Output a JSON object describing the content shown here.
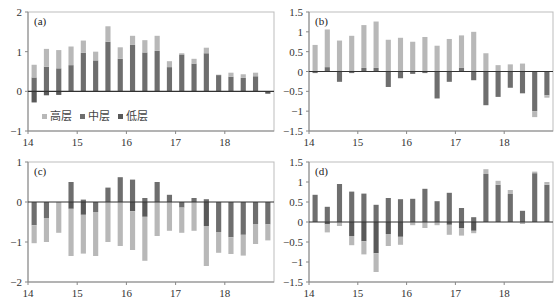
{
  "colors": {
    "high": "#b8b8b8",
    "mid": "#6e6e6e",
    "low": "#595959",
    "axis": "#333333",
    "frame": "#bdbdbd"
  },
  "legend": {
    "items": [
      {
        "label": "高层",
        "series": "high"
      },
      {
        "label": "中层",
        "series": "mid"
      },
      {
        "label": "低层",
        "series": "low"
      }
    ]
  },
  "chart_data": [
    {
      "type": "bar",
      "stacked": true,
      "panel": "(a)",
      "title": "(a)",
      "xlabel": "",
      "ylabel": "",
      "x_ticks": [
        "14",
        "15",
        "16",
        "17",
        "18"
      ],
      "y_ticks": [
        "2",
        "1",
        "0",
        "−1"
      ],
      "ylim": [
        -1,
        2
      ],
      "legend_position": "lower-left inside",
      "grid": false,
      "series": [
        {
          "name": "高层",
          "values": [
            0.32,
            0.45,
            0.46,
            0.47,
            0.31,
            0.22,
            0.39,
            0.29,
            0.23,
            0.31,
            0.38,
            0.15,
            0.03,
            0.12,
            0.14,
            0.01,
            0.1,
            0.09,
            0.09,
            0.0
          ]
        },
        {
          "name": "中层",
          "values": [
            0.35,
            0.62,
            0.58,
            0.66,
            0.97,
            0.78,
            1.25,
            0.82,
            1.17,
            0.98,
            1.02,
            0.61,
            0.93,
            0.7,
            0.96,
            0.41,
            0.37,
            0.34,
            0.38,
            0.0
          ]
        },
        {
          "name": "低层",
          "values": [
            -0.28,
            -0.1,
            -0.09,
            0.0,
            0.0,
            0.0,
            0.0,
            0.0,
            0.0,
            0.0,
            0.0,
            0.0,
            0.0,
            0.0,
            0.0,
            0.0,
            0.0,
            0.0,
            0.0,
            -0.06
          ]
        }
      ]
    },
    {
      "type": "bar",
      "stacked": true,
      "panel": "(b)",
      "title": "(b)",
      "xlabel": "",
      "ylabel": "",
      "x_ticks": [
        "14",
        "15",
        "16",
        "17",
        "18"
      ],
      "y_ticks": [
        "1.5",
        "1",
        "0.5",
        "0",
        "−0.5",
        "−1",
        "−1.5"
      ],
      "ylim": [
        -1.5,
        1.5
      ],
      "grid": false,
      "series": [
        {
          "name": "高层",
          "values": [
            0.67,
            0.95,
            0.78,
            0.9,
            1.08,
            1.17,
            0.8,
            0.85,
            0.75,
            0.87,
            0.65,
            0.82,
            0.82,
            1.0,
            0.46,
            0.16,
            0.18,
            0.2,
            -0.15,
            -0.06
          ]
        },
        {
          "name": "中层",
          "values": [
            -0.04,
            0.11,
            -0.26,
            -0.04,
            0.09,
            0.09,
            -0.39,
            -0.17,
            -0.06,
            -0.04,
            -0.68,
            -0.26,
            0.09,
            -0.22,
            -0.85,
            -0.64,
            -0.41,
            -0.55,
            -1.0,
            -0.6
          ]
        },
        {
          "name": "低层",
          "values": [
            0,
            0,
            0,
            0,
            0,
            0,
            0,
            0,
            0,
            0,
            0,
            0,
            0,
            0,
            0,
            0,
            0,
            0,
            0,
            0
          ]
        }
      ]
    },
    {
      "type": "bar",
      "stacked": true,
      "panel": "(c)",
      "title": "(c)",
      "xlabel": "",
      "ylabel": "",
      "x_ticks": [
        "14",
        "15",
        "16",
        "17",
        "18"
      ],
      "y_ticks": [
        "1",
        "0",
        "−1",
        "−2"
      ],
      "ylim": [
        -2,
        1
      ],
      "grid": false,
      "series": [
        {
          "name": "高层",
          "values": [
            -0.45,
            -0.6,
            -0.77,
            -1.18,
            -0.97,
            -1.1,
            -1.0,
            -1.1,
            -0.97,
            -1.1,
            -0.85,
            -0.72,
            -0.63,
            -0.72,
            -1.0,
            -0.52,
            -0.42,
            -0.52,
            -0.5,
            -0.4
          ]
        },
        {
          "name": "中层",
          "values": [
            -0.58,
            -0.4,
            0.0,
            0.5,
            0.06,
            -0.25,
            0.36,
            0.62,
            0.56,
            0.1,
            0.5,
            0.18,
            -0.14,
            0.1,
            0.07,
            -0.75,
            -0.88,
            -0.82,
            -0.55,
            -0.56
          ]
        },
        {
          "name": "低层",
          "values": [
            0,
            0,
            0,
            -0.17,
            -0.32,
            0,
            0,
            0,
            -0.23,
            -0.37,
            0,
            0,
            0,
            0,
            -0.6,
            0,
            0,
            0,
            0,
            0
          ]
        }
      ]
    },
    {
      "type": "bar",
      "stacked": true,
      "panel": "(d)",
      "title": "(d)",
      "xlabel": "",
      "ylabel": "",
      "x_ticks": [
        "14",
        "15",
        "16",
        "17",
        "18"
      ],
      "y_ticks": [
        "1.5",
        "1",
        "0.5",
        "0",
        "−0.5",
        "−1",
        "−1.5"
      ],
      "ylim": [
        -1.5,
        1.5
      ],
      "grid": false,
      "series": [
        {
          "name": "高层",
          "values": [
            0.0,
            -0.2,
            -0.1,
            -0.23,
            -0.33,
            -0.47,
            -0.3,
            -0.2,
            -0.08,
            -0.15,
            -0.08,
            -0.25,
            -0.18,
            -0.06,
            0.12,
            0.1,
            0.1,
            -0.05,
            0.04,
            0.07
          ]
        },
        {
          "name": "中层",
          "values": [
            0.68,
            0.38,
            0.95,
            0.76,
            0.71,
            0.43,
            0.6,
            0.57,
            0.58,
            0.83,
            0.52,
            0.73,
            0.35,
            0.12,
            1.2,
            0.93,
            0.7,
            0.28,
            1.22,
            0.93
          ]
        },
        {
          "name": "低层",
          "values": [
            0.0,
            -0.06,
            0.0,
            -0.35,
            -0.48,
            -0.78,
            -0.3,
            -0.37,
            0.0,
            0.0,
            0.0,
            -0.07,
            -0.16,
            -0.22,
            0.0,
            0.0,
            0.0,
            0.0,
            0.0,
            0.0
          ]
        }
      ]
    }
  ]
}
